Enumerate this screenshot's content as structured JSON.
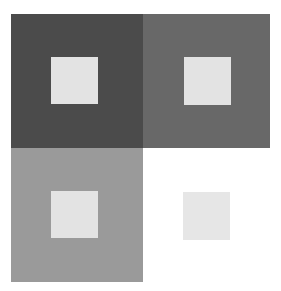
{
  "figure": {
    "background": "#ffffff",
    "cells": [
      {
        "id": "top-left",
        "bg_color": "#4b4b4b",
        "inner_color": "#e3e3e3"
      },
      {
        "id": "top-right",
        "bg_color": "#686868",
        "inner_color": "#e3e3e3"
      },
      {
        "id": "bottom-left",
        "bg_color": "#9a9a9a",
        "inner_color": "#e3e3e3"
      },
      {
        "id": "bottom-right",
        "bg_color": "#ffffff",
        "inner_color": "#e6e6e6"
      }
    ]
  }
}
